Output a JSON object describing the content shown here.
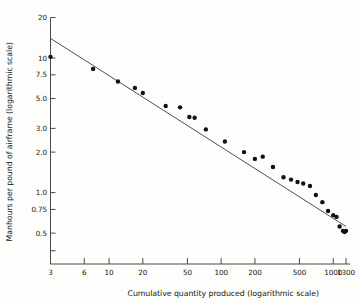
{
  "chart_data": {
    "type": "scatter",
    "title": "",
    "subtitle": "",
    "xlabel": "Cumulative quantity produced (logarithmic scale)",
    "ylabel": "Manhours per pound of airframe (logarithmic scale)",
    "xscale": "log",
    "yscale": "log",
    "xlim": [
      3,
      1300
    ],
    "ylim": [
      0.35,
      20
    ],
    "grid": false,
    "legend": null,
    "xticks": [
      {
        "value": 3,
        "label": "3"
      },
      {
        "value": 6,
        "label": "6"
      },
      {
        "value": 10,
        "label": "10"
      },
      {
        "value": 20,
        "label": "20"
      },
      {
        "value": 50,
        "label": "50"
      },
      {
        "value": 100,
        "label": "100"
      },
      {
        "value": 200,
        "label": "200"
      },
      {
        "value": 500,
        "label": "500"
      },
      {
        "value": 1000,
        "label": "1000"
      },
      {
        "value": 1300,
        "label": "1300"
      }
    ],
    "yticks": [
      {
        "value": 20,
        "label": "20"
      },
      {
        "value": 10,
        "label": "10"
      },
      {
        "value": 7.5,
        "label": "7.5"
      },
      {
        "value": 5.0,
        "label": "5.0"
      },
      {
        "value": 3.0,
        "label": "3.0"
      },
      {
        "value": 2.0,
        "label": "2.0"
      },
      {
        "value": 1.0,
        "label": "1.0"
      },
      {
        "value": 0.75,
        "label": "0.75"
      },
      {
        "value": 0.5,
        "label": "0.5"
      },
      {
        "value": 0.37,
        "label": ""
      }
    ],
    "series": [
      {
        "name": "observations",
        "type": "scatter",
        "marker": "filled-circle",
        "color": "#111111",
        "points": [
          {
            "x": 3,
            "y": 10.2
          },
          {
            "x": 7.2,
            "y": 8.3
          },
          {
            "x": 12,
            "y": 6.7
          },
          {
            "x": 17,
            "y": 6.0
          },
          {
            "x": 20,
            "y": 5.5
          },
          {
            "x": 32,
            "y": 4.4
          },
          {
            "x": 43,
            "y": 4.3
          },
          {
            "x": 52,
            "y": 3.65
          },
          {
            "x": 58,
            "y": 3.6
          },
          {
            "x": 73,
            "y": 2.95
          },
          {
            "x": 108,
            "y": 2.4
          },
          {
            "x": 160,
            "y": 2.0
          },
          {
            "x": 200,
            "y": 1.78
          },
          {
            "x": 235,
            "y": 1.85
          },
          {
            "x": 290,
            "y": 1.55
          },
          {
            "x": 360,
            "y": 1.3
          },
          {
            "x": 420,
            "y": 1.25
          },
          {
            "x": 480,
            "y": 1.2
          },
          {
            "x": 540,
            "y": 1.17
          },
          {
            "x": 620,
            "y": 1.12
          },
          {
            "x": 700,
            "y": 0.96
          },
          {
            "x": 800,
            "y": 0.85
          },
          {
            "x": 900,
            "y": 0.73
          },
          {
            "x": 1000,
            "y": 0.68
          },
          {
            "x": 1070,
            "y": 0.66
          },
          {
            "x": 1140,
            "y": 0.56
          },
          {
            "x": 1220,
            "y": 0.52
          },
          {
            "x": 1260,
            "y": 0.51
          },
          {
            "x": 1300,
            "y": 0.52
          }
        ]
      },
      {
        "name": "fitted-learning-curve",
        "type": "line",
        "color": "#3c3c3c",
        "endpoints": [
          {
            "x": 3,
            "y": 14.0
          },
          {
            "x": 1300,
            "y": 0.56
          }
        ]
      }
    ]
  }
}
